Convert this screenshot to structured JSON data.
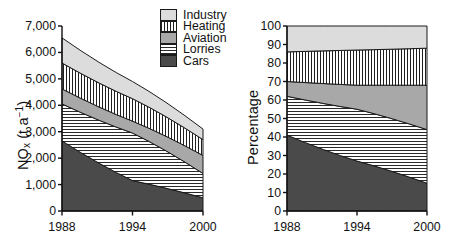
{
  "figure": {
    "panels": [
      "left-absolute",
      "right-percentage"
    ]
  },
  "legend": {
    "position": "top-center",
    "items": [
      {
        "label": "Industry",
        "pattern": "solid-light-gray",
        "color": "#dcdcdc"
      },
      {
        "label": "Heating",
        "pattern": "vertical-stripes",
        "color": "#ffffff"
      },
      {
        "label": "Aviation",
        "pattern": "solid-medium-gray",
        "color": "#a8a8a8"
      },
      {
        "label": "Lorries",
        "pattern": "horizontal-stripes",
        "color": "#ffffff"
      },
      {
        "label": "Cars",
        "pattern": "solid-dark-gray",
        "color": "#4a4a4a"
      }
    ]
  },
  "chart_data": [
    {
      "id": "left-absolute",
      "type": "area",
      "stacked": true,
      "title": "",
      "xlabel": "",
      "ylabel": "NOx (t a-1)",
      "ylabel_html": "NO<sub>x</sub> (t a<sup>−1</sup>)",
      "x": [
        1988,
        1994,
        2000
      ],
      "xlim": [
        1988,
        2000
      ],
      "ylim": [
        0,
        7000
      ],
      "xticks": [
        1988,
        1994,
        2000
      ],
      "xtick_labels": [
        "1988",
        "1994",
        "2000"
      ],
      "yticks": [
        0,
        1000,
        2000,
        3000,
        4000,
        5000,
        6000,
        7000
      ],
      "ytick_labels": [
        "0",
        "1,000",
        "2,000",
        "3,000",
        "4,000",
        "5,000",
        "6,000",
        "7,000"
      ],
      "grid": false,
      "series": [
        {
          "name": "Cars",
          "values": [
            2650,
            1150,
            500
          ]
        },
        {
          "name": "Lorries",
          "values": [
            1400,
            1800,
            920
          ]
        },
        {
          "name": "Aviation",
          "values": [
            570,
            450,
            680
          ]
        },
        {
          "name": "Heating",
          "values": [
            980,
            850,
            600
          ]
        },
        {
          "name": "Industry",
          "values": [
            950,
            650,
            400
          ]
        }
      ],
      "cumulative_tops": {
        "Cars": [
          2650,
          1150,
          500
        ],
        "Lorries": [
          4050,
          2950,
          1420
        ],
        "Aviation": [
          4620,
          3400,
          2100
        ],
        "Heating": [
          5600,
          4250,
          2700
        ],
        "Industry": [
          6550,
          4900,
          3100
        ]
      }
    },
    {
      "id": "right-percentage",
      "type": "area",
      "stacked": true,
      "title": "",
      "xlabel": "",
      "ylabel": "Percentage",
      "x": [
        1988,
        1994,
        2000
      ],
      "xlim": [
        1988,
        2000
      ],
      "ylim": [
        0,
        100
      ],
      "xticks": [
        1988,
        1994,
        2000
      ],
      "xtick_labels": [
        "1988",
        "1994",
        "2000"
      ],
      "yticks": [
        0,
        10,
        20,
        30,
        40,
        50,
        60,
        70,
        80,
        90,
        100
      ],
      "ytick_labels": [
        "0",
        "10",
        "20",
        "30",
        "40",
        "50",
        "60",
        "70",
        "80",
        "90",
        "100"
      ],
      "grid": false,
      "series": [
        {
          "name": "Cars",
          "values": [
            41,
            27,
            15
          ]
        },
        {
          "name": "Lorries",
          "values": [
            21,
            28,
            29
          ]
        },
        {
          "name": "Aviation",
          "values": [
            8,
            13,
            24
          ]
        },
        {
          "name": "Heating",
          "values": [
            16,
            19,
            20
          ]
        },
        {
          "name": "Industry",
          "values": [
            14,
            13,
            12
          ]
        }
      ],
      "cumulative_tops": {
        "Cars": [
          41,
          27,
          15
        ],
        "Lorries": [
          62,
          55,
          44
        ],
        "Aviation": [
          70,
          68,
          68
        ],
        "Heating": [
          86,
          87,
          88
        ],
        "Industry": [
          100,
          100,
          100
        ]
      }
    }
  ],
  "colors": {
    "axis": "#111111",
    "outline": "#1a1a1a",
    "background": "#ffffff"
  }
}
